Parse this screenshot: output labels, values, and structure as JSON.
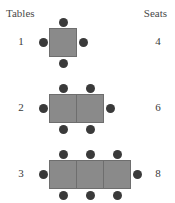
{
  "headers": {
    "left": "Tables",
    "right": "Seats"
  },
  "colors": {
    "table_fill": "#8a8a8a",
    "table_border": "#6e6e6e",
    "seat_dot": "#3a3a3a",
    "background": "#ffffff",
    "text": "#3a3a3a"
  },
  "chart_data": {
    "type": "diagram",
    "title": "",
    "xlabel": "Tables",
    "ylabel": "Seats",
    "categories": [
      "1",
      "2",
      "3"
    ],
    "values": [
      4,
      6,
      8
    ],
    "series": [
      {
        "name": "Tables",
        "values": [
          1,
          2,
          3
        ]
      },
      {
        "name": "Seats",
        "values": [
          4,
          6,
          8
        ]
      }
    ]
  },
  "rows": [
    {
      "tables_label": "1",
      "seats_label": "4",
      "table_count": 1,
      "seats": {
        "top": 1,
        "bottom": 1,
        "left": 1,
        "right": 1
      }
    },
    {
      "tables_label": "2",
      "seats_label": "6",
      "table_count": 2,
      "seats": {
        "top": 2,
        "bottom": 2,
        "left": 1,
        "right": 1
      }
    },
    {
      "tables_label": "3",
      "seats_label": "8",
      "table_count": 3,
      "seats": {
        "top": 3,
        "bottom": 3,
        "left": 1,
        "right": 1
      }
    }
  ]
}
